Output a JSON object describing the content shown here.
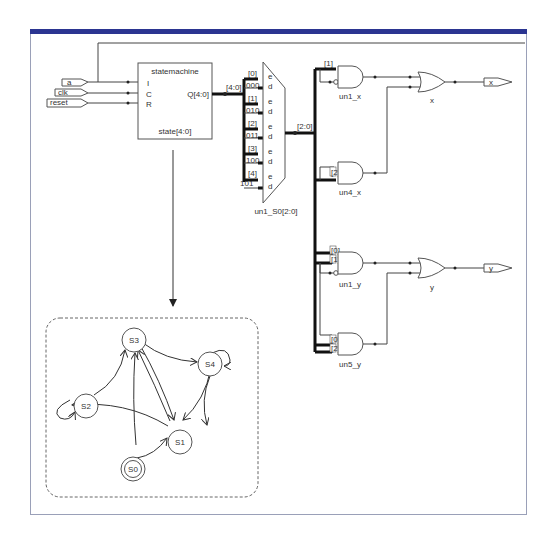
{
  "colors": {
    "topbar": "#2b3591",
    "frame_border": "#9aa0b8",
    "wire": "#444444",
    "bus": "#111111"
  },
  "inputs": [
    {
      "label": "a",
      "pin": "I"
    },
    {
      "label": "clk",
      "pin": "C"
    },
    {
      "label": "reset",
      "pin": "R"
    }
  ],
  "statemachine": {
    "title": "statemachine",
    "pins": [
      "I",
      "C",
      "R"
    ],
    "output": "Q[4:0]",
    "state_label": "state[4:0]",
    "bus_label": "[4:0]"
  },
  "mux": {
    "name": "un1_S0[2:0]",
    "out_label": "[2:0]",
    "inputs": [
      {
        "sel": "[0]",
        "code": "000",
        "e": "e",
        "d": "d"
      },
      {
        "sel": "[1]",
        "code": "010",
        "e": "e",
        "d": "d"
      },
      {
        "sel": "[2]",
        "code": "011",
        "e": "e",
        "d": "d"
      },
      {
        "sel": "[3]",
        "code": "100",
        "e": "e",
        "d": "d"
      },
      {
        "sel": "[4]",
        "code": "101",
        "e": "e",
        "d": "d"
      }
    ]
  },
  "gates": {
    "un1_x": {
      "name": "un1_x",
      "in_label": "[1]"
    },
    "un4_x": {
      "name": "un4_x",
      "in_label": "[2]"
    },
    "un1_y": {
      "name": "un1_y",
      "in_labels": [
        "[0]",
        "[1]"
      ]
    },
    "un5_y": {
      "name": "un5_y",
      "in_labels": [
        "[0]",
        "[2]"
      ]
    },
    "or_x": {
      "name": "x"
    },
    "or_y": {
      "name": "y"
    }
  },
  "outputs": [
    {
      "label": "x"
    },
    {
      "label": "y"
    }
  ],
  "state_diagram": {
    "states": [
      "S0",
      "S1",
      "S2",
      "S3",
      "S4"
    ],
    "initial": "S0",
    "transitions": [
      [
        "S0",
        "S1"
      ],
      [
        "S0",
        "S3"
      ],
      [
        "S1",
        "S2"
      ],
      [
        "S1",
        "S3"
      ],
      [
        "S3",
        "S1"
      ],
      [
        "S2",
        "S3"
      ],
      [
        "S2",
        "S2"
      ],
      [
        "S3",
        "S4"
      ],
      [
        "S4",
        "S4"
      ],
      [
        "S4",
        "S1"
      ]
    ]
  }
}
